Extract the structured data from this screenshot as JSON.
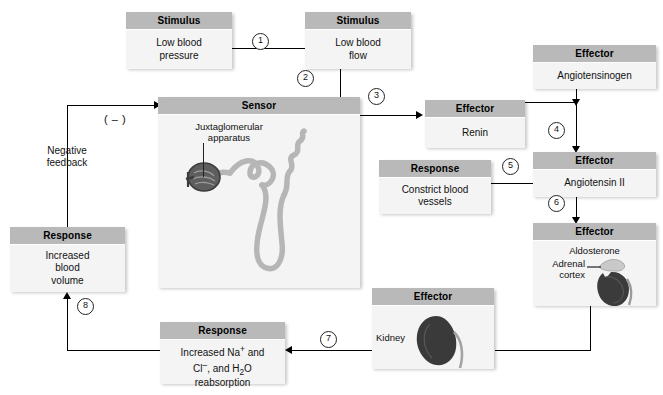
{
  "diagram": {
    "background_color": "#ffffff",
    "header_color": "#b9b9b9",
    "body_color": "#f4f4f4"
  },
  "nodes": {
    "stimulus_pressure": {
      "header": "Stimulus",
      "body": "Low blood\npressure"
    },
    "stimulus_flow": {
      "header": "Stimulus",
      "body": "Low blood\nflow"
    },
    "sensor": {
      "header": "Sensor",
      "art_label": "Juxtaglomerular\napparatus"
    },
    "effector_renin": {
      "header": "Effector",
      "body": "Renin"
    },
    "effector_angiotensinogen": {
      "header": "Effector",
      "body": "Angiotensinogen"
    },
    "effector_angiotensin2": {
      "header": "Effector",
      "body": "Angiotensin II"
    },
    "effector_aldosterone": {
      "header": "Effector",
      "body": "Aldosterone",
      "art_label": "Adrenal\ncortex"
    },
    "effector_kidney": {
      "header": "Effector",
      "art_label": "Kidney"
    },
    "response_constrict": {
      "header": "Response",
      "body": "Constrict blood\nvessels"
    },
    "response_reabsorption": {
      "header": "Response",
      "line1_pre": "Increased ",
      "line1_ion": "Na",
      "line1_sup": "+",
      "line1_post": " and",
      "line2_ion": "Cl",
      "line2_sup": "–",
      "line2_mid": ", and H",
      "line2_sub": "2",
      "line2_end": "O",
      "line3": "reabsorption"
    },
    "response_volume": {
      "header": "Response",
      "body": "Increased\nblood\nvolume"
    }
  },
  "annotations": {
    "negative_feedback_label": "Negative\nfeedback",
    "negative_sign": "( – )"
  },
  "steps": [
    {
      "id": 1,
      "label": "1"
    },
    {
      "id": 2,
      "label": "2"
    },
    {
      "id": 3,
      "label": "3"
    },
    {
      "id": 4,
      "label": "4"
    },
    {
      "id": 5,
      "label": "5"
    },
    {
      "id": 6,
      "label": "6"
    },
    {
      "id": 7,
      "label": "7"
    },
    {
      "id": 8,
      "label": "8"
    }
  ]
}
